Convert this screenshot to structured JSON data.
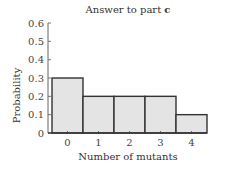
{
  "chart_data": {
    "type": "bar",
    "title": "Answer to part",
    "title_bold_suffix": "c",
    "xlabel": "Number of mutants",
    "ylabel": "Probability",
    "categories": [
      "0",
      "1",
      "2",
      "3",
      "4"
    ],
    "values": [
      0.3,
      0.2,
      0.2,
      0.2,
      0.1
    ],
    "ylim": [
      0,
      0.6
    ],
    "yticks": [
      "0",
      "0.1",
      "0.2",
      "0.3",
      "0.4",
      "0.5",
      "0.6"
    ],
    "grid": false,
    "legend": null,
    "colors": {
      "bar_fill": "#e4e4e4",
      "bar_edge": "#333333",
      "axis": "#555555"
    }
  }
}
